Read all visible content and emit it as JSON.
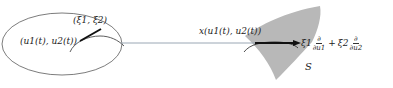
{
  "diagram": {
    "domain": {
      "point_label": "(u1(t), u2(t))",
      "vector_label": "(ξ1, ξ2)"
    },
    "surface": {
      "name": "S",
      "point_label": "x(u1(t), u2(t))",
      "vector_label": "ξ1 ∂/∂u1 + ξ2 ∂/∂u2",
      "vector_terms": [
        {
          "coef": "ξ1",
          "deriv_num": "∂",
          "deriv_den": "∂u1"
        },
        {
          "coef": "ξ2",
          "deriv_num": "∂",
          "deriv_den": "∂u2"
        }
      ],
      "operator": "+"
    },
    "colors": {
      "surface_fill": "#b8b8b8",
      "map_line": "#9aa7b4",
      "ink": "#222222"
    }
  }
}
